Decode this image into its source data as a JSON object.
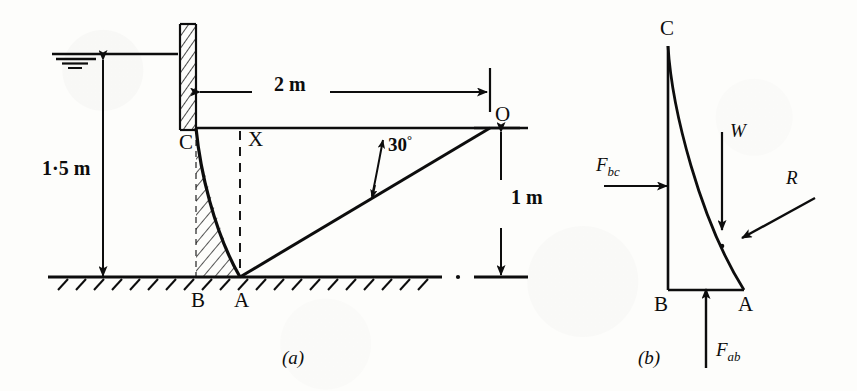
{
  "figure": {
    "kind": "engineering-diagram",
    "subfigures": [
      {
        "caption": "(a)",
        "name": "dam-section-with-dimensions"
      },
      {
        "caption": "(b)",
        "name": "free-body-force-diagram"
      }
    ]
  },
  "diagram_a": {
    "caption": "(a)",
    "points": {
      "C": "C",
      "B": "B",
      "A": "A",
      "O": "O",
      "X": "X"
    },
    "dimensions": {
      "water_depth": "1·5 m",
      "horizontal_span": "2 m",
      "vertical_height": "1 m"
    },
    "angle": {
      "value": "30",
      "unit": "°",
      "label": "30°"
    },
    "features": {
      "water_surface": "water-level-symbol",
      "wall": "hatched-vertical-wall",
      "ground": "hatched-ground-line",
      "pressure_region": "hatched-curved-pressure-area",
      "centroid_line": "dashed-vertical-line-X"
    }
  },
  "diagram_b": {
    "caption": "(b)",
    "points": {
      "C": "C",
      "B": "B",
      "A": "A"
    },
    "forces": [
      {
        "id": "F_bc",
        "symbol": "F",
        "subscript": "bc",
        "direction": "horizontal-right",
        "name": "horizontal-water-thrust"
      },
      {
        "id": "W",
        "symbol": "W",
        "subscript": "",
        "direction": "vertical-down",
        "name": "weight"
      },
      {
        "id": "R",
        "symbol": "R",
        "subscript": "",
        "direction": "diagonal-up-left",
        "name": "resultant-reaction"
      },
      {
        "id": "F_ab",
        "symbol": "F",
        "subscript": "ab",
        "direction": "vertical-up",
        "name": "base-vertical-force"
      }
    ]
  },
  "colors": {
    "ink": "#0d0d0d",
    "paper": "#fdfdfb"
  }
}
